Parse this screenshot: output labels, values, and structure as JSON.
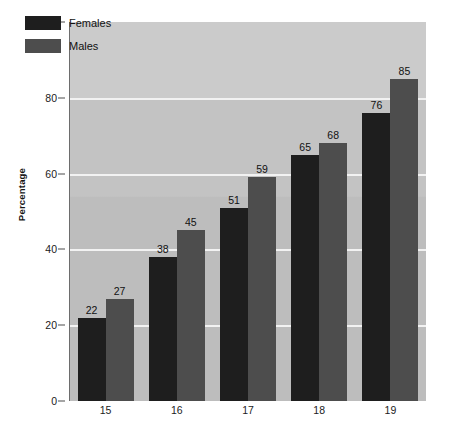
{
  "chart_data": {
    "type": "bar",
    "title": "",
    "subtitle": "",
    "xlabel": "",
    "ylabel": "Percentage",
    "categories": [
      "15",
      "16",
      "17",
      "18",
      "19"
    ],
    "series": [
      {
        "name": "Females",
        "color": "#1e1e1e",
        "values": [
          22,
          38,
          51,
          65,
          76
        ]
      },
      {
        "name": "Males",
        "color": "#4d4d4d",
        "values": [
          27,
          45,
          59,
          68,
          85
        ]
      }
    ],
    "ylim": [
      0,
      100
    ],
    "yticks": [
      0,
      20,
      40,
      60,
      80,
      100
    ],
    "grid": true,
    "gridlines_at": [
      20,
      40,
      60,
      80
    ],
    "legend_position": "top-left",
    "data_labels": true,
    "plot_background": "#c3c3c3",
    "gridline_color": "#f2f2f2",
    "axis_color": "#6d6d6d"
  },
  "legend": {
    "entries": [
      {
        "label": "Females"
      },
      {
        "label": "Males"
      }
    ]
  }
}
